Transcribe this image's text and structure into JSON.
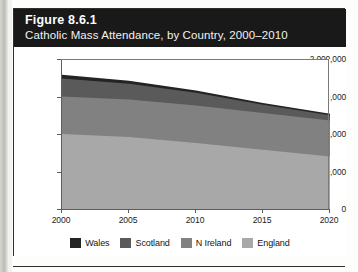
{
  "figure": {
    "number_label": "Figure 8.6.1",
    "caption": "Catholic Mass Attendance, by Country, 2000–2010"
  },
  "chart_data": {
    "type": "area",
    "stacked": true,
    "title": "Catholic Mass Attendance, by Country, 2000–2010",
    "xlabel": "",
    "ylabel": "",
    "x": [
      2000,
      2005,
      2010,
      2015,
      2020
    ],
    "xlim": [
      2000,
      2020
    ],
    "ylim": [
      0,
      2000000
    ],
    "xticks": [
      2000,
      2005,
      2010,
      2015,
      2020
    ],
    "xtick_labels": [
      "2000",
      "2005",
      "2010",
      "2015",
      "2020"
    ],
    "yticks": [
      0,
      500000,
      1000000,
      1500000,
      2000000
    ],
    "ytick_labels": [
      "0",
      "500,000",
      "1,000,000",
      "1,500,000",
      "2,000,000"
    ],
    "grid": false,
    "gridlines_drawn": [
      1500000
    ],
    "legend_position": "bottom",
    "stack_order_bottom_to_top": [
      "England",
      "N Ireland",
      "Scotland",
      "Wales"
    ],
    "series": [
      {
        "name": "England",
        "color": "#a8a8a8",
        "values": [
          1000000,
          960000,
          880000,
          790000,
          700000
        ],
        "cumulative_top": [
          1000000,
          960000,
          880000,
          790000,
          700000
        ]
      },
      {
        "name": "N Ireland",
        "color": "#818181",
        "values": [
          500000,
          500000,
          500000,
          490000,
          480000
        ],
        "cumulative_top": [
          1500000,
          1460000,
          1380000,
          1280000,
          1180000
        ]
      },
      {
        "name": "Scotland",
        "color": "#5a5a5a",
        "values": [
          240000,
          210000,
          170000,
          110000,
          70000
        ],
        "cumulative_top": [
          1740000,
          1670000,
          1550000,
          1390000,
          1250000
        ]
      },
      {
        "name": "Wales",
        "color": "#242424",
        "values": [
          50000,
          40000,
          30000,
          25000,
          20000
        ],
        "cumulative_top": [
          1790000,
          1710000,
          1580000,
          1415000,
          1270000
        ]
      }
    ],
    "totals": [
      1790000,
      1710000,
      1580000,
      1415000,
      1270000
    ]
  },
  "legend": {
    "items": [
      {
        "label": "Wales",
        "color": "#242424"
      },
      {
        "label": "Scotland",
        "color": "#5a5a5a"
      },
      {
        "label": "N Ireland",
        "color": "#818181"
      },
      {
        "label": "England",
        "color": "#a8a8a8"
      }
    ]
  }
}
